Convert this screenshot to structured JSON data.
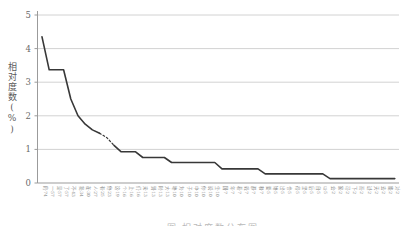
{
  "chart_data": {
    "type": "line",
    "title": "",
    "xlabel": "",
    "ylabel": "相对度数(%)",
    "ylim": [
      0,
      5
    ],
    "yticks": [
      0,
      1,
      2,
      3,
      4,
      5
    ],
    "grid": true,
    "legend_position": "none",
    "x_tick_rotation": 90,
    "line_color": "#383838",
    "grid_color": "#d2d2d2",
    "axis_color": "#9b9b9b",
    "tick_label_color": "#8a8a8a",
    "dashed_segment_indices": [
      8,
      10
    ],
    "categories": [
      "的·74",
      "一·57",
      "是·57",
      "了·57",
      "不·43",
      "我·34",
      "在·30",
      "人·27",
      "有·25",
      "他·23",
      "这·19",
      "个·16",
      "上·16",
      "们·16",
      "来·13",
      "到·13",
      "时·13",
      "大·13",
      "地·10",
      "为·10",
      "子·10",
      "中·10",
      "你·10",
      "说·10",
      "生·10",
      "国·7",
      "年·7",
      "着·7",
      "就·7",
      "那·7",
      "和·7",
      "要·5",
      "她·5",
      "出·5",
      "也·5",
      "得·5",
      "里·5",
      "后·5",
      "自·5",
      "以·5",
      "会·2",
      "家·2",
      "可·2",
      "下·2",
      "而·2",
      "过·2",
      "天·2",
      "去·2",
      "能·2",
      "对·2"
    ],
    "values": [
      4.35,
      3.37,
      3.37,
      3.37,
      2.5,
      2.0,
      1.75,
      1.58,
      1.48,
      1.35,
      1.12,
      0.93,
      0.93,
      0.93,
      0.76,
      0.76,
      0.76,
      0.76,
      0.61,
      0.61,
      0.61,
      0.61,
      0.61,
      0.61,
      0.61,
      0.42,
      0.42,
      0.42,
      0.42,
      0.42,
      0.42,
      0.27,
      0.27,
      0.27,
      0.27,
      0.27,
      0.27,
      0.27,
      0.27,
      0.27,
      0.13,
      0.13,
      0.13,
      0.13,
      0.13,
      0.13,
      0.13,
      0.13,
      0.13,
      0.13
    ]
  },
  "caption": "图 相对度数分布图"
}
